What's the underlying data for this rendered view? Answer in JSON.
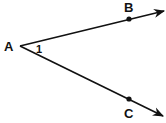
{
  "diagram": {
    "type": "angle",
    "vertex": {
      "label": "A",
      "x": 20,
      "y": 46
    },
    "angle_label": "1",
    "rays": [
      {
        "name": "ray-AB",
        "point": {
          "label": "B",
          "x": 129,
          "y": 19
        },
        "end": {
          "x": 164,
          "y": 11
        }
      },
      {
        "name": "ray-AC",
        "point": {
          "label": "C",
          "x": 129,
          "y": 99
        },
        "end": {
          "x": 163,
          "y": 116
        }
      }
    ],
    "colors": {
      "stroke": "#111111",
      "background": "#ffffff"
    }
  }
}
